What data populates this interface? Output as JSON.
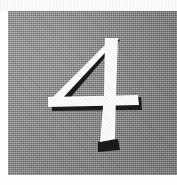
{
  "page": {
    "background_color": "#fefefe",
    "width": 177,
    "height": 185,
    "top_margin_label": ""
  },
  "plate": {
    "name": "numeral-plate",
    "background_color": "#8c8c8c",
    "texture": "halftone-dither",
    "left": 8,
    "top": 11,
    "width": 169,
    "height": 164
  },
  "numeral": {
    "value": "4",
    "character": "4",
    "style": "embossed",
    "face_color": "#fbfbfb",
    "shadow_color": "#151515",
    "shadow_direction": "lower-right"
  },
  "caption": {
    "text": ""
  }
}
